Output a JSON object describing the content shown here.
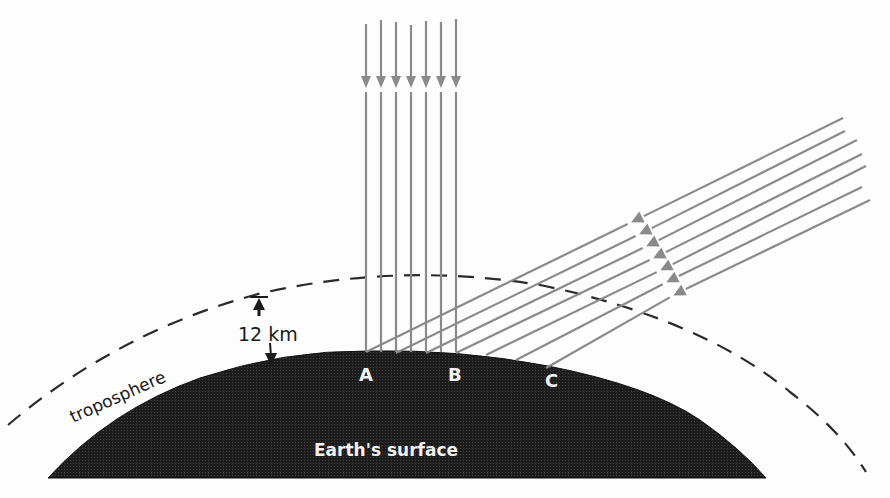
{
  "figure": {
    "colors": {
      "background": "#fdfdfd",
      "earth_fill": "#1c1c1c",
      "ray": "#8a8a8a",
      "troposphere_dash": "#2a2a2a",
      "label_dark": "#1a1a1a",
      "label_light": "#f2f2f2"
    }
  },
  "labels": {
    "troposphere": "troposphere",
    "thickness": "12 km",
    "earth_surface": "Earth's surface",
    "point_a": "A",
    "point_b": "B",
    "point_c": "C"
  },
  "vertical_rays": {
    "count": 7,
    "x": [
      366,
      381,
      396,
      411,
      426,
      441,
      456
    ],
    "top_y": [
      24,
      20,
      22,
      25,
      21,
      22,
      19
    ],
    "arrow_y": 82,
    "bottom_y": 352
  },
  "oblique_rays": {
    "count": 7,
    "start": [
      [
        843,
        118
      ],
      [
        845,
        131
      ],
      [
        857,
        140
      ],
      [
        862,
        154
      ],
      [
        866,
        166
      ],
      [
        862,
        187
      ],
      [
        870,
        200
      ]
    ],
    "arrow": [
      [
        642,
        217
      ],
      [
        650,
        229
      ],
      [
        657,
        241
      ],
      [
        664,
        253
      ],
      [
        671,
        265
      ],
      [
        677,
        277
      ],
      [
        684,
        290
      ]
    ],
    "end": [
      [
        366,
        352
      ],
      [
        396,
        353
      ],
      [
        426,
        353
      ],
      [
        456,
        353
      ],
      [
        486,
        355
      ],
      [
        516,
        360
      ],
      [
        546,
        368
      ]
    ]
  },
  "points": {
    "A": {
      "x": 368,
      "y": 351
    },
    "B": {
      "x": 456,
      "y": 352
    },
    "C": {
      "x": 548,
      "y": 368
    }
  }
}
